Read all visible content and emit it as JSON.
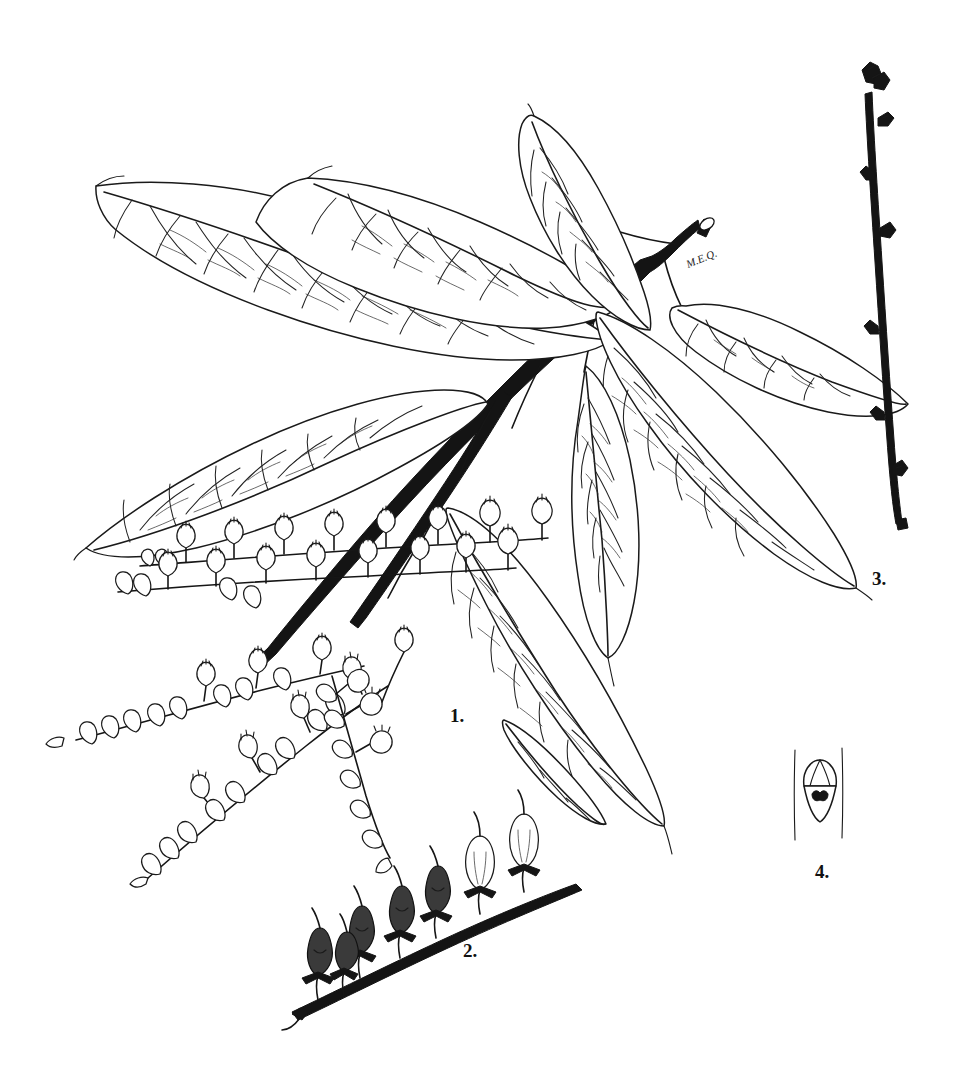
{
  "plate": {
    "kind": "botanical-line-illustration",
    "medium": "pen-and-ink line drawing",
    "background_color": "#ffffff",
    "ink_color": "#151515",
    "width": 960,
    "height": 1074,
    "signature": "M.E.Q."
  },
  "figures": [
    {
      "id": "fig1",
      "label": "1.",
      "label_x": 450,
      "label_y": 722,
      "caption": "Leafy branch with fruiting racemes",
      "parts": [
        "main woody branch, solid black, cut at upper right",
        "alternate elliptic-lanceolate leaves, acuminate tips, finely serrate margins",
        "pinnate secondary venation with reticulate tertiary veins",
        "several one-sided racemes of urn-shaped capsules"
      ]
    },
    {
      "id": "fig2",
      "label": "2.",
      "label_x": 463,
      "label_y": 957,
      "caption": "Enlarged fruiting raceme with mature capsules",
      "parts": [
        "stout dark rachis ascending to the right",
        "ovoid shaded capsules on short pedicels",
        "persistent star-shaped calyx lobes and slender styles"
      ]
    },
    {
      "id": "fig3",
      "label": "3.",
      "label_x": 872,
      "label_y": 585,
      "caption": "Winter twig with terminal and lateral buds",
      "parts": [
        "slender dark twig, nearly vertical",
        "cluster of terminal buds at the apex",
        "alternate lateral buds along the length"
      ]
    },
    {
      "id": "fig4",
      "label": "4.",
      "label_x": 815,
      "label_y": 878,
      "caption": "Detail of bud above shield-shaped leaf scar",
      "parts": [
        "two vertical lines representing the twig margins",
        "three-scaled bud",
        "shield-shaped leaf scar with dark bundle traces"
      ]
    }
  ],
  "leaves": [
    {
      "name": "upper-left-long-leaf",
      "tip": "left",
      "length_px": 360
    },
    {
      "name": "upper-middle-leaf",
      "tip": "upper-left",
      "length_px": 300
    },
    {
      "name": "upper-right-erect-leaf",
      "tip": "up",
      "length_px": 230
    },
    {
      "name": "mid-left-broad-leaf",
      "tip": "left",
      "length_px": 330
    },
    {
      "name": "right-lower-leaf",
      "tip": "lower-right",
      "length_px": 330
    },
    {
      "name": "center-hanging-leaf",
      "tip": "down",
      "length_px": 300
    },
    {
      "name": "center-lower-leaf",
      "tip": "lower-left",
      "length_px": 290
    },
    {
      "name": "right-upper-leaf",
      "tip": "right",
      "length_px": 270
    }
  ],
  "racemes": [
    {
      "name": "upper-horizontal-raceme",
      "capsule_count": 8,
      "orientation": "horizontal"
    },
    {
      "name": "second-horizontal-raceme",
      "capsule_count": 8,
      "orientation": "horizontal"
    },
    {
      "name": "left-ascending-raceme",
      "capsule_count": 12,
      "orientation": "ascending-left"
    },
    {
      "name": "left-descending-raceme",
      "capsule_count": 13,
      "orientation": "descending-left"
    },
    {
      "name": "center-pendent-raceme",
      "capsule_count": 11,
      "orientation": "pendent"
    },
    {
      "name": "enlarged-raceme-fig2",
      "capsule_count": 7,
      "orientation": "ascending-right"
    }
  ]
}
